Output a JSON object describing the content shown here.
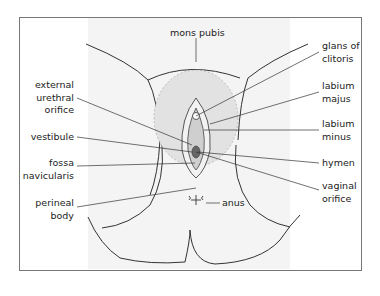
{
  "diagram": {
    "labels_left": [
      {
        "id": "external-urethral-orifice",
        "lines": [
          "external",
          "urethral",
          "orifice"
        ]
      },
      {
        "id": "vestibule",
        "lines": [
          "vestibule"
        ]
      },
      {
        "id": "fossa-navicularis",
        "lines": [
          "fossa",
          "navicularis"
        ]
      },
      {
        "id": "perineal-body",
        "lines": [
          "perineal",
          "body"
        ]
      }
    ],
    "labels_right": [
      {
        "id": "glans-of-clitoris",
        "lines": [
          "glans of",
          "clitoris"
        ]
      },
      {
        "id": "labium-majus",
        "lines": [
          "labium",
          "majus"
        ]
      },
      {
        "id": "labium-minus",
        "lines": [
          "labium",
          "minus"
        ]
      },
      {
        "id": "hymen",
        "lines": [
          "hymen"
        ]
      },
      {
        "id": "vaginal-orifice",
        "lines": [
          "vaginal",
          "orifice"
        ]
      }
    ],
    "labels_top": [
      {
        "id": "mons-pubis",
        "lines": [
          "mons pubis"
        ]
      }
    ],
    "labels_center": [
      {
        "id": "anus",
        "lines": [
          "anus"
        ]
      }
    ]
  },
  "t": {
    "mons": "mons pubis",
    "glans1": "glans of",
    "glans2": "clitoris",
    "majus1": "labium",
    "majus2": "majus",
    "minus1": "labium",
    "minus2": "minus",
    "hymen": "hymen",
    "vag1": "vaginal",
    "vag2": "orifice",
    "ext1": "external",
    "ext2": "urethral",
    "ext3": "orifice",
    "vest": "vestibule",
    "fossa1": "fossa",
    "fossa2": "navicularis",
    "peri1": "perineal",
    "peri2": "body",
    "anus": "anus"
  }
}
